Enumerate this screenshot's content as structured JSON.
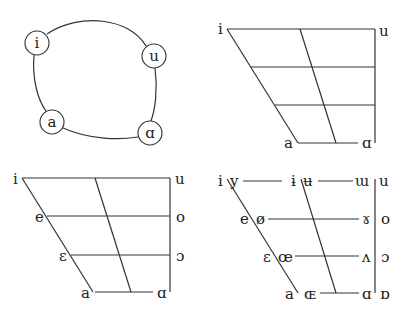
{
  "panels": {
    "circle_diagram": {
      "nodes": [
        {
          "label": "i",
          "x": 37,
          "y": 43
        },
        {
          "label": "u",
          "x": 154,
          "y": 56
        },
        {
          "label": "a",
          "x": 52,
          "y": 122
        },
        {
          "label": "ɑ",
          "x": 150,
          "y": 133
        }
      ]
    },
    "trapezoid_basic": {
      "corner_labels": {
        "top_left": "i",
        "top_right": "u",
        "bottom_left": "a",
        "bottom_right": "ɑ"
      }
    },
    "trapezoid_cardinal": {
      "front": [
        "i",
        "e",
        "ɛ",
        "a"
      ],
      "back": [
        "u",
        "o",
        "ɔ",
        "ɑ"
      ]
    },
    "trapezoid_full": {
      "rows": [
        {
          "front_unrounded": "i",
          "front_rounded": "y",
          "central_unrounded": "ɨ",
          "central_rounded": "ʉ",
          "back_unrounded": "ɯ",
          "back_rounded": "u"
        },
        {
          "front_unrounded": "e",
          "front_rounded": "ø",
          "back_unrounded": "ɤ",
          "back_rounded": "o"
        },
        {
          "front_unrounded": "ɛ",
          "front_rounded": "œ",
          "back_unrounded": "ʌ",
          "back_rounded": "ɔ"
        },
        {
          "front_unrounded": "a",
          "front_rounded": "ɶ",
          "back_unrounded": "ɑ",
          "back_rounded": "ɒ"
        }
      ]
    }
  }
}
